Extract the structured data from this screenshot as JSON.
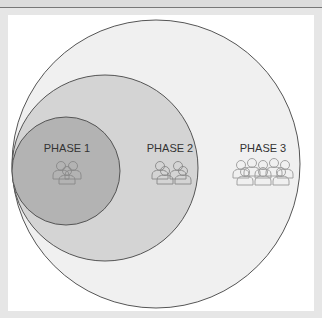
{
  "diagram": {
    "type": "nested-circles",
    "phases": [
      {
        "label": "PHASE 1",
        "people_icons": 1,
        "fill": "#b3b3b3"
      },
      {
        "label": "PHASE 2",
        "people_icons": 2,
        "fill": "#d4d4d4"
      },
      {
        "label": "PHASE 3",
        "people_icons": 3,
        "fill": "#f0f0f0"
      }
    ],
    "stroke": "#555555"
  }
}
